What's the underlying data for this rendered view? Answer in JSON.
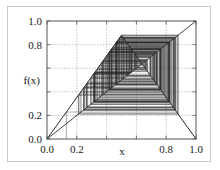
{
  "chart_data": {
    "type": "line",
    "title": "",
    "xlabel": "x",
    "ylabel": "f(x)",
    "xlim": [
      0.0,
      1.0
    ],
    "ylim": [
      0.0,
      1.0
    ],
    "grid": true,
    "legend": null,
    "x_ticks": [
      0.0,
      0.2,
      0.4,
      0.6,
      0.8,
      1.0
    ],
    "x_tick_labels": [
      "0.0",
      "0.2",
      "",
      "",
      "0.8",
      "1.0"
    ],
    "y_ticks": [
      0.0,
      0.2,
      0.4,
      0.6,
      0.8,
      1.0
    ],
    "y_tick_labels": [
      "0.0",
      "0.2",
      "",
      "",
      "0.8",
      "1.0"
    ],
    "series": [
      {
        "name": "map f(x)",
        "kind": "tent-map",
        "x": [
          0.0,
          0.5,
          1.0
        ],
        "values": [
          0.0,
          0.88,
          0.0
        ]
      },
      {
        "name": "identity y = x",
        "kind": "diagonal",
        "x": [
          0.0,
          1.0
        ],
        "values": [
          0.0,
          1.0
        ]
      },
      {
        "name": "cobweb iteration",
        "kind": "cobweb",
        "seed": 0.13,
        "iterations": 220,
        "peak": 0.88,
        "attractor_band": [
          0.2,
          0.88
        ]
      }
    ],
    "annotations": []
  },
  "axes": {
    "x_axis_label": "x",
    "y_axis_label": "f(x)",
    "x_labels": [
      "0.0",
      "0.2",
      "0.8",
      "1.0"
    ],
    "y_labels": [
      "1.0",
      "0.8",
      "0.2",
      "0.0"
    ]
  },
  "colors": {
    "plot_line": "#2b2b2b",
    "grid": "#9a9a9a",
    "axis": "#555555",
    "frame": "#c9c9c9",
    "background": "#ffffff",
    "text": "#1a1a1a"
  }
}
